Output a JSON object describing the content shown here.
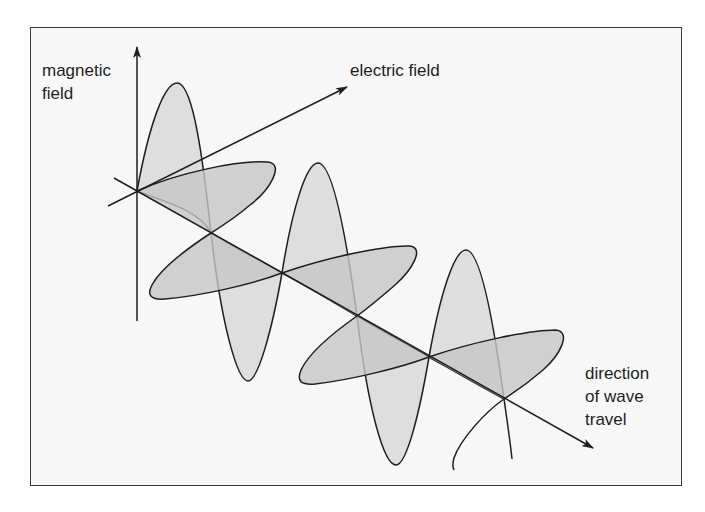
{
  "diagram": {
    "labels": {
      "magnetic_field": [
        "magnetic",
        "field"
      ],
      "electric_field": "electric field",
      "direction_of_travel": [
        "direction",
        "of wave",
        "travel"
      ]
    },
    "colors": {
      "background": "#f7f7f7",
      "frame": "#3a3a3a",
      "stroke": "#1e1e1e",
      "magnetic_fill": "#d9d9d9",
      "electric_fill": "#c6c6c6"
    },
    "axes": {
      "origin": [
        137,
        191
      ],
      "magnetic_axis": {
        "from": [
          137,
          321
        ],
        "to": [
          137,
          47
        ]
      },
      "electric_axis": {
        "from": [
          108,
          206
        ],
        "to": [
          347,
          87
        ]
      },
      "travel_axis": {
        "from": [
          114,
          178
        ],
        "to": [
          593,
          448
        ]
      }
    },
    "nodes": [
      [
        137,
        191
      ],
      [
        211,
        233
      ],
      [
        282,
        273
      ],
      [
        357,
        316
      ],
      [
        429,
        357
      ],
      [
        504,
        399
      ]
    ],
    "magnetic_lobes": [
      {
        "from": 0,
        "to": 1,
        "tip": [
          177,
          83
        ],
        "direction": "up"
      },
      {
        "from": 1,
        "to": 2,
        "tip": [
          248,
          381
        ],
        "direction": "down"
      },
      {
        "from": 2,
        "to": 3,
        "tip": [
          318,
          163
        ],
        "direction": "up"
      },
      {
        "from": 3,
        "to": 4,
        "tip": [
          396,
          465
        ],
        "direction": "down"
      },
      {
        "from": 4,
        "to": 5,
        "tip": [
          466,
          250
        ],
        "direction": "up"
      }
    ],
    "electric_lobes": [
      {
        "from": 0,
        "to": 1,
        "tip": [
          270,
          163
        ],
        "direction": "right"
      },
      {
        "from": 1,
        "to": 2,
        "tip": [
          151,
          298
        ],
        "direction": "left"
      },
      {
        "from": 2,
        "to": 3,
        "tip": [
          416,
          248
        ],
        "direction": "right"
      },
      {
        "from": 3,
        "to": 4,
        "tip": [
          300,
          383
        ],
        "direction": "left"
      },
      {
        "from": 4,
        "to": 5,
        "tip": [
          562,
          332
        ],
        "direction": "right"
      }
    ]
  }
}
